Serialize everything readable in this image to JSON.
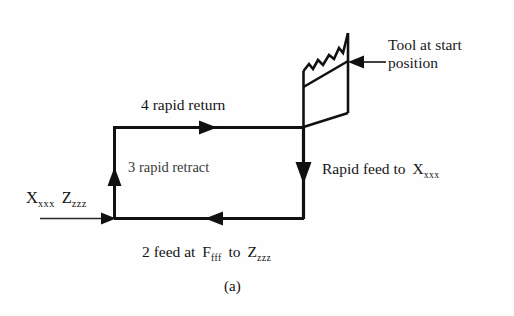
{
  "figure": {
    "caption": "(a)",
    "background_color": "#fefefe",
    "stroke_color": "#111111"
  },
  "labels": {
    "tool_line1": "Tool at start",
    "tool_line2": "position",
    "rapid_return": "4 rapid return",
    "rapid_retract": "3  rapid retract",
    "rapid_feed_prefix": "Rapid feed to",
    "rapid_feed_axis": "X",
    "rapid_feed_axis_sub": "xxx",
    "start_axis_x": "X",
    "start_axis_x_sub": "xxx",
    "start_axis_z": "Z",
    "start_axis_z_sub": "zzz",
    "feed_prefix": "2 feed at",
    "feed_rate_symbol": "F",
    "feed_rate_sub": "fff",
    "feed_to": "to",
    "feed_target": "Z",
    "feed_target_sub": "zzz"
  },
  "diagram_data": {
    "type": "toolpath-diagram",
    "description": "CNC lathe canned-cycle tool path rectangle with four numbered motion segments and a workpiece/tool parallelogram at the start position",
    "path_rectangle": {
      "left_x": 114,
      "right_x": 303,
      "top_y": 127,
      "bottom_y": 218
    },
    "segments": [
      {
        "number": 2,
        "name": "feed",
        "from": [
          303,
          218
        ],
        "to": [
          114,
          218
        ],
        "direction": "left",
        "label": "2 feed at F fff to Z zzz"
      },
      {
        "number": 3,
        "name": "rapid retract",
        "from": [
          114,
          218
        ],
        "to": [
          114,
          127
        ],
        "direction": "up",
        "label": "3 rapid retract"
      },
      {
        "number": 4,
        "name": "rapid return",
        "from": [
          114,
          127
        ],
        "to": [
          303,
          127
        ],
        "direction": "right",
        "label": "4 rapid return"
      },
      {
        "number": 1,
        "name": "rapid feed",
        "from": [
          303,
          127
        ],
        "to": [
          303,
          218
        ],
        "direction": "down",
        "label": "Rapid feed to X xxx"
      }
    ],
    "entry_arrow": {
      "from": [
        40,
        218
      ],
      "to": [
        113,
        218
      ],
      "direction": "right"
    },
    "leader_arrow": {
      "from": [
        385,
        62
      ],
      "to": [
        350,
        62
      ],
      "direction": "left"
    },
    "tool_shape": {
      "type": "parallelogram-with-torn-top",
      "top_right": [
        348,
        33
      ],
      "right_lower": [
        348,
        113
      ],
      "bottom_left": [
        303,
        127
      ],
      "left_upper": [
        303,
        72
      ]
    }
  }
}
